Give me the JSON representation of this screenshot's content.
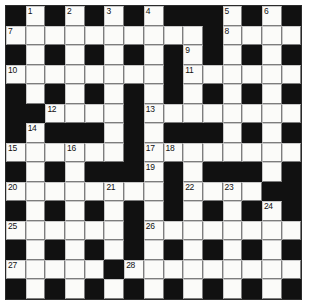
{
  "puzzle": {
    "title": "Crossword Grid",
    "rows": 15,
    "cols": 15,
    "colors": {
      "block": "#111111",
      "cell": "#fbfbf9",
      "gridline": "#7d7d7d",
      "number": "#111111",
      "background": "#ffffff"
    },
    "legend": {
      "block_char": "#",
      "open_char": "."
    },
    "layout": [
      "#.#.#.#.###.#.#",
      "..........#....",
      "#.#.#.#.#.#.#.#",
      "........#......",
      "#.#.#.#.#.#.#.#",
      "##....#........",
      "#.###.#.###.#.#",
      "......#........",
      "#.#.###.#.###.#",
      "........#....##",
      "#.#.#.#.#.#.#.#",
      "......#........",
      "#.#.#.#.#.#.#.#",
      ".....#.........",
      "#.#.#.#.#.#.#.#"
    ],
    "numbers": [
      {
        "n": "1",
        "row": 0,
        "col": 1
      },
      {
        "n": "2",
        "row": 0,
        "col": 3
      },
      {
        "n": "3",
        "row": 0,
        "col": 5
      },
      {
        "n": "4",
        "row": 0,
        "col": 7
      },
      {
        "n": "5",
        "row": 0,
        "col": 11
      },
      {
        "n": "6",
        "row": 0,
        "col": 13
      },
      {
        "n": "7",
        "row": 1,
        "col": 0
      },
      {
        "n": "8",
        "row": 1,
        "col": 11
      },
      {
        "n": "9",
        "row": 2,
        "col": 9
      },
      {
        "n": "10",
        "row": 3,
        "col": 0
      },
      {
        "n": "11",
        "row": 3,
        "col": 9
      },
      {
        "n": "12",
        "row": 5,
        "col": 2
      },
      {
        "n": "13",
        "row": 5,
        "col": 7
      },
      {
        "n": "14",
        "row": 6,
        "col": 1
      },
      {
        "n": "15",
        "row": 7,
        "col": 0
      },
      {
        "n": "16",
        "row": 7,
        "col": 3
      },
      {
        "n": "17",
        "row": 7,
        "col": 7
      },
      {
        "n": "18",
        "row": 7,
        "col": 8
      },
      {
        "n": "19",
        "row": 8,
        "col": 7
      },
      {
        "n": "20",
        "row": 9,
        "col": 0
      },
      {
        "n": "21",
        "row": 9,
        "col": 5
      },
      {
        "n": "22",
        "row": 9,
        "col": 9
      },
      {
        "n": "23",
        "row": 9,
        "col": 11
      },
      {
        "n": "24",
        "row": 10,
        "col": 13
      },
      {
        "n": "25",
        "row": 11,
        "col": 0
      },
      {
        "n": "26",
        "row": 11,
        "col": 7
      },
      {
        "n": "27",
        "row": 13,
        "col": 0
      },
      {
        "n": "28",
        "row": 13,
        "col": 6
      }
    ]
  }
}
